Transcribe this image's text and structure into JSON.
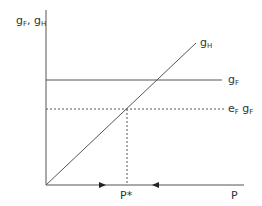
{
  "diagram": {
    "y_axis_label": {
      "main": "g",
      "sub1": "F",
      "sep": ", g",
      "sub2": "H"
    },
    "curve_gH_label": {
      "main": "g",
      "sub": "H"
    },
    "curve_gF_label": {
      "main": "g",
      "sub": "F"
    },
    "dashed_label": {
      "e": "e",
      "e_sub": "F",
      "g": " g",
      "g_sub": "F"
    },
    "x_axis_label": "P",
    "equilibrium_label": "P*",
    "colors": {
      "line": "#555555",
      "text": "#333333"
    }
  }
}
